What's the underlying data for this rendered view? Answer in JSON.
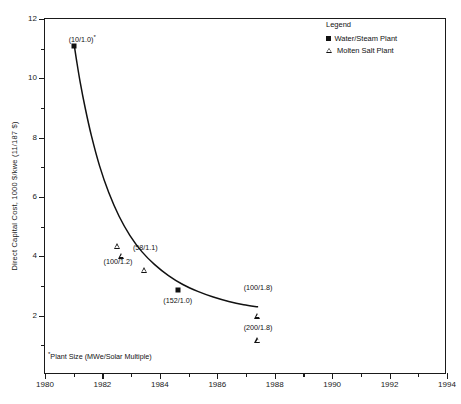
{
  "chart_data": {
    "type": "scatter",
    "title": "",
    "xlabel": "",
    "ylabel": "Direct Capital Cost, 1000 $/kwe (11/187 $)",
    "xlim": [
      1980,
      1994
    ],
    "ylim": [
      0,
      12
    ],
    "x_major_ticks": [
      1980,
      1982,
      1984,
      1986,
      1988,
      1990,
      1992,
      1994
    ],
    "x_minor_ticks": [
      1981,
      1983,
      1985,
      1987,
      1989,
      1991,
      1993
    ],
    "y_major_ticks": [
      2,
      4,
      6,
      8,
      10,
      12
    ],
    "y_minor_ticks": [
      1,
      3,
      5,
      7,
      9,
      11
    ],
    "x_tick_labels": [
      "1980",
      "1982",
      "1984",
      "1986",
      "1988",
      "1990",
      "1992",
      "1994"
    ],
    "y_tick_labels": [
      "2",
      "4",
      "6",
      "8",
      "10",
      "12"
    ],
    "grid": false,
    "legend_position": "top-right",
    "curve": {
      "name": "Direct capital cost trend",
      "x": [
        1981.02,
        1981.1,
        1981.22,
        1981.4,
        1981.62,
        1981.9,
        1982.22,
        1982.58,
        1982.96,
        1983.38,
        1983.82,
        1984.3,
        1984.8,
        1985.32,
        1985.86,
        1986.4,
        1986.92,
        1987.4
      ],
      "y": [
        11.1,
        10.6,
        9.9,
        9.0,
        8.05,
        7.05,
        6.15,
        5.35,
        4.7,
        4.15,
        3.72,
        3.35,
        3.05,
        2.82,
        2.63,
        2.48,
        2.37,
        2.3
      ]
    },
    "series": [
      {
        "name": "Water/Steam Plant",
        "marker": "square",
        "points": [
          {
            "x": 1981.02,
            "y": 11.1,
            "label": "(10/1.0)",
            "footnote_marker": "*",
            "label_dx": 8,
            "label_dy": -13
          },
          {
            "x": 1984.62,
            "y": 2.85,
            "label": "(152/1.0)",
            "footnote_marker": "",
            "label_dx": 0,
            "label_dy": 7
          }
        ]
      },
      {
        "name": "Molten Salt Plant",
        "marker": "triangle",
        "points": [
          {
            "x": 1982.52,
            "y": 4.35,
            "label": "",
            "footnote_marker": "",
            "label_dx": 0,
            "label_dy": 0
          },
          {
            "x": 1982.68,
            "y": 4.22,
            "label": "(100/1.2)",
            "footnote_marker": "",
            "label_dx": -4,
            "label_dy": 8
          },
          {
            "x": 1983.46,
            "y": 3.93,
            "label": "(58/1.1)",
            "footnote_marker": "",
            "label_dx": 1,
            "label_dy": -14
          },
          {
            "x": 1987.42,
            "y": 2.6,
            "label": "(100/1.8)",
            "footnote_marker": "",
            "label_dx": 0,
            "label_dy": -14
          },
          {
            "x": 1987.42,
            "y": 1.98,
            "label": "(200/1.8)",
            "footnote_marker": "",
            "label_dx": 0,
            "label_dy": 8
          }
        ]
      }
    ]
  },
  "legend": {
    "title": "Legend",
    "entries": [
      {
        "marker": "square",
        "label": "Water/Steam Plant"
      },
      {
        "marker": "triangle",
        "label": "Molten Salt Plant"
      }
    ]
  },
  "footnote": {
    "marker": "*",
    "text": "Plant Size (MWe/Solar Multiple)"
  },
  "colors": {
    "ink": "#111111",
    "axis": "#1a1a1a",
    "background": "#ffffff"
  }
}
